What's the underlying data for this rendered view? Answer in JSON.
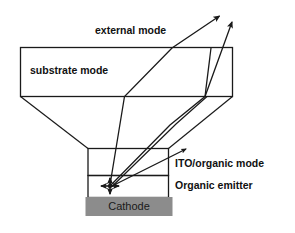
{
  "figure": {
    "background_color": "#ffffff",
    "line_color": "#1a1a1a",
    "text_color": "#111111"
  },
  "labels": {
    "external_mode": "external mode",
    "substrate_mode": "substrate mode",
    "ito_organic_mode": "ITO/organic mode",
    "organic_emitter": "Organic emitter",
    "cathode": "Cathode"
  },
  "layers": {
    "substrate": {
      "name": "substrate mode",
      "fill": "#ffffff",
      "stroke": "#1a1a1a"
    },
    "ito": {
      "name": "ITO/organic mode",
      "fill": "#ffffff",
      "stroke": "#1a1a1a"
    },
    "emitter": {
      "name": "Organic emitter",
      "fill": "#ffffff",
      "stroke": "#1a1a1a"
    },
    "cathode": {
      "name": "Cathode",
      "fill": "#8c8c8c",
      "stroke": "#4d4d4d"
    }
  },
  "rays": [
    {
      "name": "external-ray-1",
      "description": "ray escaping through substrate into external mode",
      "arrowhead": true
    },
    {
      "name": "external-ray-2",
      "description": "second ray escaping into external mode",
      "arrowhead": true
    },
    {
      "name": "ito-organic-ray",
      "description": "ray trapped in ITO/organic layer",
      "arrowhead": true
    }
  ],
  "emission_point": {
    "name": "emission-point",
    "description": "four-way arrow cluster marking isotropic emission in organic emitter"
  }
}
